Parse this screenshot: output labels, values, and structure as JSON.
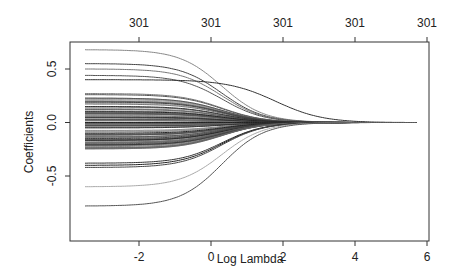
{
  "chart_data": {
    "type": "line",
    "title": "",
    "xlabel": "Log Lambda",
    "ylabel": "Coefficients",
    "xlim": [
      -3.7,
      6.2
    ],
    "ylim": [
      -0.88,
      0.78
    ],
    "x_ticks": [
      -2,
      0,
      2,
      4,
      6
    ],
    "x_tick_labels": [
      "-2",
      "0",
      "2",
      "4",
      "6"
    ],
    "y_ticks": [
      -0.5,
      0.0,
      0.5
    ],
    "y_tick_labels": [
      "-0.5",
      "0.0",
      "0.5"
    ],
    "top_axis_ticks": [
      -2,
      0,
      2,
      4,
      6
    ],
    "top_axis_labels": [
      "301",
      "301",
      "301",
      "301",
      "301"
    ],
    "grid": false,
    "legend": null,
    "x_range_of_paths": [
      -3.5,
      5.7
    ],
    "series_description": "Coefficient paths for ~100 predictors shrinking toward 0 as Log Lambda increases (lasso/glmnet style). Paths converge to 0 at about x=5.7.",
    "series": [
      {
        "name": "path-1",
        "start": 0.68,
        "color": "#888888"
      },
      {
        "name": "path-2",
        "start": 0.55,
        "color": "#444444"
      },
      {
        "name": "path-3",
        "start": 0.5,
        "color": "#777777"
      },
      {
        "name": "path-4",
        "start": 0.44,
        "color": "#555555"
      },
      {
        "name": "path-5",
        "start": 0.4,
        "color": "#333333",
        "note": "persistent path, ~0.40 at x=0, still ~0.1 at x=3"
      },
      {
        "name": "path-6",
        "start": 0.27,
        "color": "#777777"
      },
      {
        "name": "path-7",
        "start": 0.26,
        "color": "#555555"
      },
      {
        "name": "path-8",
        "start": 0.19,
        "color": "#444444"
      },
      {
        "name": "path-9",
        "start": 0.15,
        "color": "#333333"
      },
      {
        "name": "path-10",
        "start": 0.1,
        "color": "#222222"
      },
      {
        "name": "path-11",
        "start": 0.05,
        "color": "#333333"
      },
      {
        "name": "path-12",
        "start": 0.0,
        "color": "#222222"
      },
      {
        "name": "path-13",
        "start": -0.05,
        "color": "#333333"
      },
      {
        "name": "path-14",
        "start": -0.1,
        "color": "#222222"
      },
      {
        "name": "path-15",
        "start": -0.15,
        "color": "#444444"
      },
      {
        "name": "path-16",
        "start": -0.2,
        "color": "#555555"
      },
      {
        "name": "path-17",
        "start": -0.24,
        "color": "#666666"
      },
      {
        "name": "path-18",
        "start": -0.38,
        "color": "#333333"
      },
      {
        "name": "path-19",
        "start": -0.4,
        "color": "#222222"
      },
      {
        "name": "path-20",
        "start": -0.42,
        "color": "#444444"
      },
      {
        "name": "path-21",
        "start": -0.6,
        "color": "#aaaaaa"
      },
      {
        "name": "path-22",
        "start": -0.78,
        "color": "#555555"
      }
    ]
  }
}
